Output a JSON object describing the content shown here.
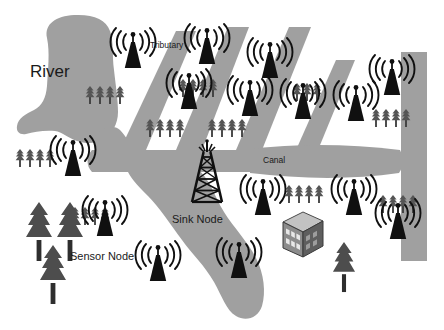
{
  "diagram": {
    "type": "schematic-map",
    "canvas": {
      "width": 444,
      "height": 330
    },
    "palette": {
      "water": "#a0a0a0",
      "water_edge": "#9a9a9a",
      "background": "#ffffff",
      "node_black": "#101010",
      "tree_gray": "#4d4d4d",
      "small_tree_gray": "#555555",
      "building_gray": "#6e6e6e",
      "building_light": "#b8b8b8",
      "label_text": "#1a1a1a"
    },
    "labels": [
      {
        "id": "river",
        "text": "River",
        "x": 30,
        "y": 62,
        "size": 17
      },
      {
        "id": "tributary",
        "text": "Tributary",
        "x": 150,
        "y": 40,
        "size": 8.5
      },
      {
        "id": "canal",
        "text": "Canal",
        "x": 263,
        "y": 155,
        "size": 8.5
      },
      {
        "id": "sink",
        "text": "Sink Node",
        "x": 172,
        "y": 213,
        "size": 11
      },
      {
        "id": "sensor",
        "text": "Sensor Node",
        "x": 70,
        "y": 250,
        "size": 11
      }
    ],
    "water_features": [
      {
        "id": "river-main",
        "name": "River",
        "kind": "river-body"
      },
      {
        "id": "river-tail",
        "name": "River outflow",
        "kind": "river-channel"
      },
      {
        "id": "tributary-1",
        "name": "Tributary",
        "kind": "tributary"
      },
      {
        "id": "tributary-2",
        "name": "Tributary",
        "kind": "tributary"
      },
      {
        "id": "tributary-3",
        "name": "Tributary",
        "kind": "tributary"
      },
      {
        "id": "tributary-4",
        "name": "Tributary",
        "kind": "tributary"
      },
      {
        "id": "canal-horizontal",
        "name": "Canal",
        "kind": "canal"
      },
      {
        "id": "canal-vertical",
        "name": "Canal",
        "kind": "canal"
      }
    ],
    "sink_node": {
      "id": "sink-node",
      "label": "Sink Node",
      "x": 207,
      "y": 182,
      "kind": "lattice-tower"
    },
    "sensor_nodes": [
      {
        "id": "sensor-node-01",
        "x": 133,
        "y": 52
      },
      {
        "id": "sensor-node-02",
        "x": 207,
        "y": 48
      },
      {
        "id": "sensor-node-03",
        "x": 189,
        "y": 93
      },
      {
        "id": "sensor-node-04",
        "x": 270,
        "y": 62
      },
      {
        "id": "sensor-node-05",
        "x": 250,
        "y": 100
      },
      {
        "id": "sensor-node-06",
        "x": 303,
        "y": 103
      },
      {
        "id": "sensor-node-07",
        "x": 356,
        "y": 105
      },
      {
        "id": "sensor-node-08",
        "x": 392,
        "y": 79
      },
      {
        "id": "sensor-node-09",
        "x": 73,
        "y": 160
      },
      {
        "id": "sensor-node-10",
        "x": 263,
        "y": 199
      },
      {
        "id": "sensor-node-11",
        "x": 354,
        "y": 199
      },
      {
        "id": "sensor-node-12",
        "x": 398,
        "y": 223
      },
      {
        "id": "sensor-node-13",
        "x": 105,
        "y": 220
      },
      {
        "id": "sensor-node-14",
        "x": 158,
        "y": 265
      },
      {
        "id": "sensor-node-15",
        "x": 239,
        "y": 262
      }
    ],
    "tree_clusters": [
      {
        "id": "tree-cluster-01",
        "x": 88,
        "y": 88,
        "count": 4
      },
      {
        "id": "tree-cluster-02",
        "x": 180,
        "y": 80,
        "count": 4
      },
      {
        "id": "tree-cluster-03",
        "x": 145,
        "y": 118,
        "count": 4
      },
      {
        "id": "tree-cluster-04",
        "x": 207,
        "y": 118,
        "count": 4
      },
      {
        "id": "tree-cluster-05",
        "x": 295,
        "y": 82,
        "count": 3
      },
      {
        "id": "tree-cluster-06",
        "x": 374,
        "y": 110,
        "count": 4
      },
      {
        "id": "tree-cluster-07",
        "x": 16,
        "y": 148,
        "count": 4
      },
      {
        "id": "tree-cluster-08",
        "x": 286,
        "y": 185,
        "count": 4
      },
      {
        "id": "tree-cluster-09",
        "x": 380,
        "y": 195,
        "count": 4
      },
      {
        "id": "tree-cluster-10",
        "x": 72,
        "y": 208,
        "count": 4
      }
    ],
    "pine_trees": [
      {
        "id": "pine-tree-01",
        "x": 36,
        "y": 200,
        "scale": 1.0
      },
      {
        "id": "pine-tree-02",
        "x": 66,
        "y": 200,
        "scale": 1.0
      },
      {
        "id": "pine-tree-03",
        "x": 50,
        "y": 243,
        "scale": 1.0
      },
      {
        "id": "pine-tree-04",
        "x": 344,
        "y": 262,
        "scale": 0.85
      }
    ],
    "building": {
      "id": "data-center-building",
      "label": "",
      "x": 285,
      "y": 215
    }
  }
}
